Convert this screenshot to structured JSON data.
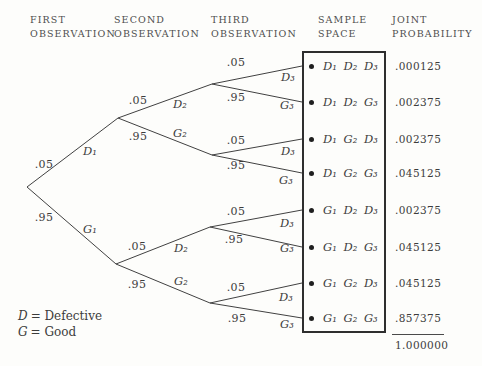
{
  "columns": [
    {
      "line1": "FIRST",
      "line2": "OBSERVATION"
    },
    {
      "line1": "SECOND",
      "line2": "OBSERVATION"
    },
    {
      "line1": "THIRD",
      "line2": "OBSERVATION"
    },
    {
      "line1": "SAMPLE",
      "line2": "SPACE"
    },
    {
      "line1": "JOINT",
      "line2": "PROBABILITY"
    }
  ],
  "tree": {
    "level1": [
      {
        "prob": ".05",
        "label": "D₁"
      },
      {
        "prob": ".95",
        "label": "G₁"
      }
    ],
    "level2": [
      {
        "prob": ".05",
        "label": "D₂"
      },
      {
        "prob": ".95",
        "label": "G₂"
      },
      {
        "prob": ".05",
        "label": "D₂"
      },
      {
        "prob": ".95",
        "label": "G₂"
      }
    ],
    "level3": [
      {
        "prob": ".05",
        "label": "D₃"
      },
      {
        "prob": ".95",
        "label": "G₃"
      },
      {
        "prob": ".05",
        "label": "D₃"
      },
      {
        "prob": ".95",
        "label": "G₃"
      },
      {
        "prob": ".05",
        "label": "D₃"
      },
      {
        "prob": ".95",
        "label": "G₃"
      },
      {
        "prob": ".05",
        "label": "D₃"
      },
      {
        "prob": ".95",
        "label": "G₃"
      }
    ]
  },
  "icons": {
    "bullet": "●"
  },
  "sample_space": {
    "rows": [
      "D₁ D₂ D₃",
      "D₁ D₂ G₃",
      "D₁ G₂ D₃",
      "D₁ G₂ G₃",
      "G₁ D₂ D₃",
      "G₁ D₂ G₃",
      "G₁ G₂ D₃",
      "G₁ G₂ G₃"
    ]
  },
  "joint_probability": {
    "values": [
      ".000125",
      ".002375",
      ".002375",
      ".045125",
      ".002375",
      ".045125",
      ".045125",
      ".857375"
    ],
    "total": "1.000000"
  },
  "legend": {
    "d_symbol": "D",
    "d_text": "= Defective",
    "g_symbol": "G",
    "g_text": "= Good"
  }
}
